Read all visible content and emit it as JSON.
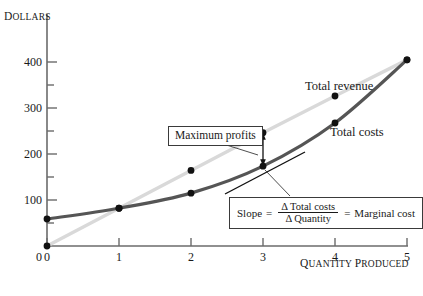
{
  "axes": {
    "y_title": "Dollars",
    "x_title": "Quantity produced",
    "y_ticks_major": [
      "400",
      "300",
      "200",
      "100",
      "0"
    ],
    "x_ticks": [
      "0",
      "1",
      "2",
      "3",
      "4",
      "5"
    ]
  },
  "labels": {
    "total_revenue": "Total revenue",
    "total_costs": "Total costs",
    "max_profits": "Maximum profits"
  },
  "slope_box": {
    "slope_word": "Slope",
    "equals_1": "=",
    "numerator": "Δ Total costs",
    "denominator": "Δ Quantity",
    "equals_2": "=",
    "result": "Marginal cost"
  },
  "colors": {
    "total_revenue": "#d9d9d9",
    "total_costs": "#555555",
    "axis": "#6b6b6b",
    "marker": "#111111",
    "text": "#1a1a1a",
    "tangent": "#111111",
    "background": "#ffffff"
  },
  "chart_data": {
    "type": "line",
    "title": "",
    "xlabel": "Quantity produced",
    "ylabel": "Dollars",
    "xlim": [
      0,
      5
    ],
    "ylim": [
      0,
      430
    ],
    "grid": false,
    "legend_position": "inline-right",
    "x": [
      0,
      1,
      2,
      3,
      4,
      5
    ],
    "y_ticks_major": [
      0,
      100,
      200,
      300,
      400
    ],
    "y_ticks_minor": [
      50,
      150,
      250,
      350
    ],
    "series": [
      {
        "name": "Total revenue",
        "color": "#d9d9d9",
        "values": [
          0,
          70,
          140,
          210,
          278,
          345
        ],
        "markers": [
          true,
          true,
          true,
          true,
          true,
          true
        ]
      },
      {
        "name": "Total costs",
        "color": "#555555",
        "values": [
          50,
          70,
          98,
          148,
          228,
          345
        ],
        "markers": [
          true,
          true,
          true,
          true,
          true,
          true
        ]
      }
    ],
    "annotations": [
      {
        "name": "maximum-profits",
        "text": "Maximum profits",
        "at_x": 3,
        "gap_from": 148,
        "gap_to": 210,
        "gap_value": 62
      },
      {
        "name": "slope-marginal-cost",
        "text": "Slope = Δ Total costs / Δ Quantity = Marginal cost",
        "tangent_at_x": 3,
        "tangent_at_y": 148
      }
    ]
  }
}
